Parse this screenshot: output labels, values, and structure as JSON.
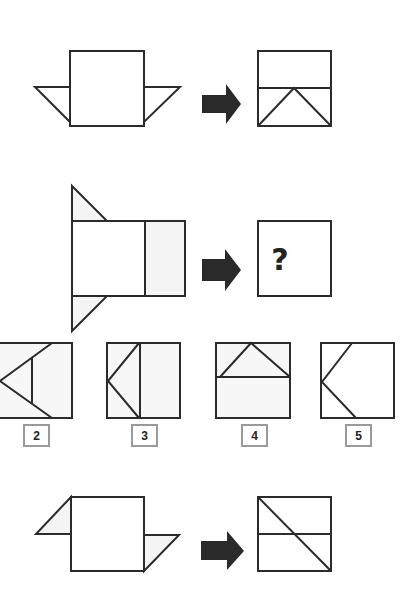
{
  "puzzle": {
    "type": "paper folding analogy",
    "question_mark": "?",
    "examples": [
      {
        "name": "example-1",
        "description": "square with triangular flaps on both sides folded down to bottom triangles"
      },
      {
        "name": "example-2",
        "description": "square with parallelogram flaps folded to diagonal"
      }
    ],
    "options": [
      {
        "label": "2"
      },
      {
        "label": "3"
      },
      {
        "label": "4"
      },
      {
        "label": "5"
      }
    ]
  },
  "colors": {
    "stroke": "#2b2b2b",
    "arrow": "#2a2a2a",
    "label_border": "#9a9a9a",
    "fill_light": "#f4f4f4"
  }
}
